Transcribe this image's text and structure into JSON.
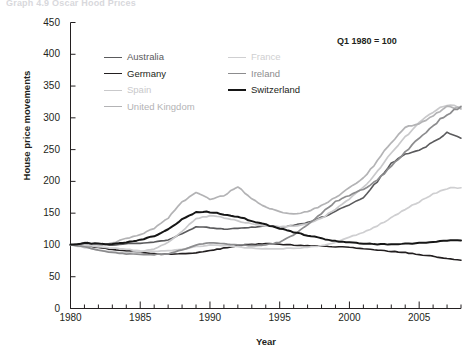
{
  "cutoff_title": "Graph 4.9  Oscar Hood Prices",
  "note": "Q1 1980 = 100",
  "axes": {
    "ylabel": "House price movements",
    "xlabel": "Year",
    "yticks": [
      0,
      50,
      100,
      150,
      200,
      250,
      300,
      350,
      400,
      450
    ],
    "ylim": [
      0,
      450
    ],
    "xticks": [
      1980,
      1985,
      1990,
      1995,
      2000,
      2005
    ],
    "xlim": [
      1980,
      2008
    ]
  },
  "legend": {
    "columns": [
      [
        {
          "label": "Australia",
          "color": "#5a5a5c",
          "width": 1.6
        },
        {
          "label": "Germany",
          "color": "#231f20",
          "width": 1.6
        },
        {
          "label": "Spain",
          "color": "#c9c9cb",
          "width": 1.6
        },
        {
          "label": "United Kingdom",
          "color": "#b3b3b5",
          "width": 1.6
        }
      ],
      [
        {
          "label": "France",
          "color": "#cfcfd1",
          "width": 1.6
        },
        {
          "label": "Ireland",
          "color": "#8c8c8e",
          "width": 1.6
        },
        {
          "label": "Switzerland",
          "color": "#161616",
          "width": 2.0
        }
      ]
    ]
  },
  "chart_data": {
    "type": "line",
    "title": "",
    "xlabel": "Year",
    "ylabel": "House price movements",
    "xlim": [
      1980,
      2008
    ],
    "ylim": [
      0,
      450
    ],
    "grid": false,
    "legend_position": "top-inside",
    "annotation": "Q1 1980 = 100",
    "x": [
      1980,
      1981,
      1982,
      1983,
      1984,
      1985,
      1986,
      1987,
      1988,
      1989,
      1990,
      1991,
      1992,
      1993,
      1994,
      1995,
      1996,
      1997,
      1998,
      1999,
      2000,
      2001,
      2002,
      2003,
      2004,
      2005,
      2006,
      2007,
      2008
    ],
    "series": [
      {
        "name": "Australia",
        "color": "#5a5a5c",
        "width": 1.6,
        "values": [
          100,
          103,
          101,
          100,
          102,
          103,
          104,
          108,
          118,
          128,
          127,
          125,
          126,
          128,
          130,
          128,
          131,
          135,
          143,
          153,
          163,
          175,
          200,
          228,
          243,
          248,
          262,
          276,
          268
        ]
      },
      {
        "name": "Germany",
        "color": "#231f20",
        "width": 1.6,
        "values": [
          100,
          99,
          96,
          93,
          91,
          88,
          86,
          85,
          86,
          88,
          91,
          95,
          99,
          101,
          102,
          101,
          100,
          99,
          98,
          97,
          96,
          94,
          92,
          90,
          88,
          85,
          82,
          79,
          76
        ]
      },
      {
        "name": "Spain",
        "color": "#c9c9cb",
        "width": 1.7,
        "values": [
          100,
          96,
          92,
          89,
          88,
          89,
          94,
          104,
          122,
          141,
          146,
          143,
          138,
          133,
          130,
          129,
          130,
          133,
          142,
          156,
          172,
          190,
          216,
          244,
          270,
          292,
          310,
          320,
          316
        ]
      },
      {
        "name": "United Kingdom",
        "color": "#b3b3b5",
        "width": 1.7,
        "values": [
          100,
          101,
          100,
          103,
          110,
          116,
          126,
          142,
          168,
          182,
          172,
          178,
          192,
          172,
          160,
          152,
          149,
          152,
          162,
          175,
          190,
          205,
          232,
          262,
          284,
          292,
          302,
          318,
          314
        ]
      },
      {
        "name": "France",
        "color": "#cfcfd1",
        "width": 1.7,
        "values": [
          100,
          99,
          97,
          95,
          93,
          91,
          90,
          91,
          93,
          97,
          100,
          99,
          97,
          95,
          94,
          94,
          95,
          96,
          99,
          104,
          112,
          120,
          130,
          143,
          156,
          168,
          180,
          189,
          190
        ]
      },
      {
        "name": "Ireland",
        "color": "#8c8c8e",
        "width": 1.7,
        "values": [
          100,
          97,
          92,
          88,
          86,
          85,
          85,
          86,
          92,
          100,
          103,
          102,
          100,
          99,
          100,
          104,
          116,
          131,
          150,
          168,
          178,
          188,
          202,
          224,
          246,
          268,
          288,
          306,
          318
        ]
      },
      {
        "name": "Switzerland",
        "color": "#161616",
        "width": 2.0,
        "values": [
          100,
          103,
          102,
          101,
          104,
          108,
          114,
          124,
          140,
          152,
          152,
          148,
          144,
          138,
          132,
          126,
          120,
          115,
          110,
          106,
          104,
          102,
          101,
          101,
          102,
          103,
          105,
          107,
          107
        ]
      }
    ]
  }
}
